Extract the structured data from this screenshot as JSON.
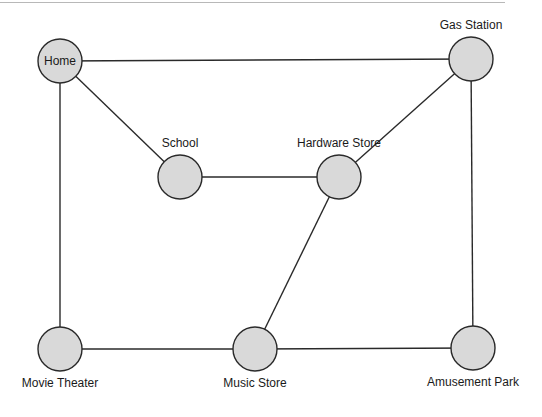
{
  "diagram": {
    "type": "undirected-graph",
    "node_fill": "#d9d9d9",
    "node_stroke": "#2a2a2a",
    "edge_color": "#2a2a2a",
    "nodes": [
      {
        "id": "home",
        "label": "Home",
        "x": 60,
        "y": 61,
        "label_pos": "inside"
      },
      {
        "id": "school",
        "label": "School",
        "x": 180,
        "y": 177,
        "label_pos": "above"
      },
      {
        "id": "hardware",
        "label": "Hardware Store",
        "x": 339,
        "y": 177,
        "label_pos": "above"
      },
      {
        "id": "gas",
        "label": "Gas Station",
        "x": 471,
        "y": 59,
        "label_pos": "above"
      },
      {
        "id": "movie",
        "label": "Movie Theater",
        "x": 60,
        "y": 349,
        "label_pos": "below"
      },
      {
        "id": "music",
        "label": "Music Store",
        "x": 255,
        "y": 349,
        "label_pos": "below"
      },
      {
        "id": "amusement",
        "label": "Amusement Park",
        "x": 473,
        "y": 348,
        "label_pos": "below"
      }
    ],
    "edges": [
      [
        "home",
        "gas"
      ],
      [
        "home",
        "school"
      ],
      [
        "home",
        "movie"
      ],
      [
        "school",
        "hardware"
      ],
      [
        "hardware",
        "gas"
      ],
      [
        "hardware",
        "music"
      ],
      [
        "gas",
        "amusement"
      ],
      [
        "movie",
        "music"
      ],
      [
        "music",
        "amusement"
      ]
    ]
  }
}
